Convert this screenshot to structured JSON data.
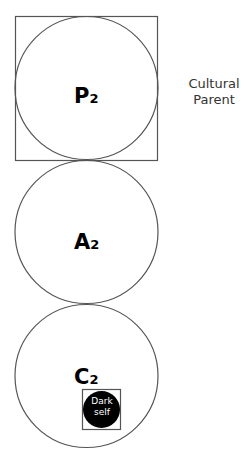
{
  "diagram": {
    "type": "ego-state stack",
    "nodes": [
      {
        "id": "P",
        "letter": "P",
        "subscript": "2",
        "boxed": true
      },
      {
        "id": "A",
        "letter": "A",
        "subscript": "2",
        "boxed": false
      },
      {
        "id": "C",
        "letter": "C",
        "subscript": "2",
        "boxed": false
      }
    ],
    "side_label": {
      "line1": "Cultural",
      "line2": "Parent"
    },
    "dark_self": {
      "line1": "Dark",
      "line2": "self"
    },
    "colors": {
      "stroke": "#555555",
      "fill": "#ffffff",
      "dark_fill": "#000000",
      "text": "#000000"
    }
  }
}
